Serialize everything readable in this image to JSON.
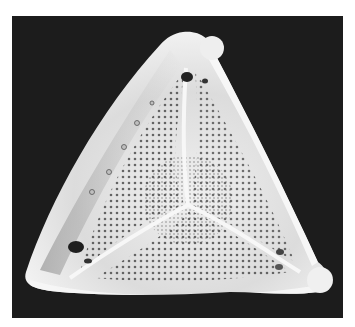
{
  "image": {
    "subject": "diatom frustule micrograph",
    "alt": "Grayscale electron micrograph of a triangular diatom valve with porous areolae and rounded lobes at each corner",
    "colors": {
      "background_border": "#ffffff",
      "frame": "#1c1c1c",
      "valve": "#e6e6e6",
      "pores": "#2a2a2a",
      "shadow": "#8a8a8a"
    }
  }
}
